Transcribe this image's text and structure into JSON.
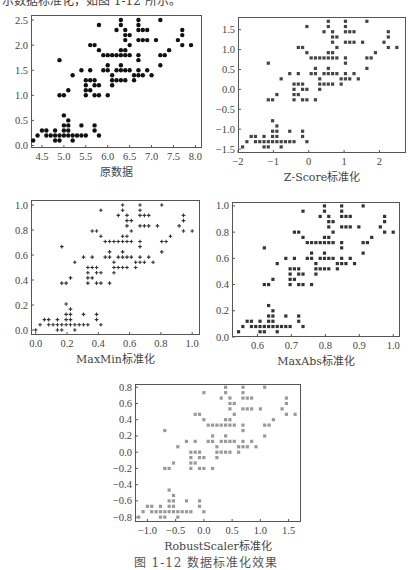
{
  "page": {
    "top_text": "示数据标准化，如图 1-12 所示。",
    "caption": "图 1-12  数据标准化效果"
  },
  "raw_points": [
    [
      5.1,
      0.2
    ],
    [
      4.9,
      0.2
    ],
    [
      4.7,
      0.2
    ],
    [
      4.6,
      0.2
    ],
    [
      5.0,
      0.2
    ],
    [
      5.4,
      0.4
    ],
    [
      4.6,
      0.3
    ],
    [
      5.0,
      0.2
    ],
    [
      4.4,
      0.2
    ],
    [
      4.9,
      0.1
    ],
    [
      5.4,
      0.2
    ],
    [
      4.8,
      0.2
    ],
    [
      4.8,
      0.1
    ],
    [
      4.3,
      0.1
    ],
    [
      5.8,
      0.2
    ],
    [
      5.7,
      0.4
    ],
    [
      5.4,
      0.4
    ],
    [
      5.1,
      0.3
    ],
    [
      5.7,
      0.3
    ],
    [
      5.1,
      0.3
    ],
    [
      5.4,
      0.2
    ],
    [
      5.1,
      0.4
    ],
    [
      4.6,
      0.2
    ],
    [
      5.1,
      0.5
    ],
    [
      4.8,
      0.2
    ],
    [
      5.0,
      0.2
    ],
    [
      5.0,
      0.4
    ],
    [
      5.2,
      0.2
    ],
    [
      5.2,
      0.2
    ],
    [
      4.7,
      0.2
    ],
    [
      4.8,
      0.2
    ],
    [
      5.4,
      0.4
    ],
    [
      5.2,
      0.1
    ],
    [
      5.5,
      0.2
    ],
    [
      4.9,
      0.2
    ],
    [
      5.0,
      0.2
    ],
    [
      5.5,
      0.2
    ],
    [
      4.9,
      0.1
    ],
    [
      4.4,
      0.2
    ],
    [
      5.1,
      0.2
    ],
    [
      5.0,
      0.3
    ],
    [
      4.5,
      0.3
    ],
    [
      4.4,
      0.2
    ],
    [
      5.0,
      0.6
    ],
    [
      5.1,
      0.4
    ],
    [
      4.8,
      0.3
    ],
    [
      5.1,
      0.2
    ],
    [
      4.6,
      0.2
    ],
    [
      5.3,
      0.2
    ],
    [
      5.0,
      0.2
    ],
    [
      7.0,
      1.4
    ],
    [
      6.4,
      1.5
    ],
    [
      6.9,
      1.5
    ],
    [
      5.5,
      1.3
    ],
    [
      6.5,
      1.5
    ],
    [
      5.7,
      1.3
    ],
    [
      6.3,
      1.6
    ],
    [
      4.9,
      1.0
    ],
    [
      6.6,
      1.3
    ],
    [
      5.2,
      1.4
    ],
    [
      5.0,
      1.0
    ],
    [
      5.9,
      1.5
    ],
    [
      6.0,
      1.0
    ],
    [
      6.1,
      1.4
    ],
    [
      5.6,
      1.3
    ],
    [
      6.7,
      1.4
    ],
    [
      5.6,
      1.5
    ],
    [
      5.8,
      1.0
    ],
    [
      6.2,
      1.5
    ],
    [
      5.6,
      1.1
    ],
    [
      5.9,
      1.8
    ],
    [
      6.1,
      1.3
    ],
    [
      6.3,
      1.5
    ],
    [
      6.1,
      1.2
    ],
    [
      6.4,
      1.3
    ],
    [
      6.6,
      1.4
    ],
    [
      6.8,
      1.4
    ],
    [
      6.7,
      1.7
    ],
    [
      6.0,
      1.5
    ],
    [
      5.7,
      1.0
    ],
    [
      5.5,
      1.1
    ],
    [
      5.5,
      1.0
    ],
    [
      5.8,
      1.2
    ],
    [
      6.0,
      1.6
    ],
    [
      5.4,
      1.5
    ],
    [
      6.0,
      1.6
    ],
    [
      6.7,
      1.5
    ],
    [
      6.3,
      1.3
    ],
    [
      5.6,
      1.3
    ],
    [
      5.5,
      1.3
    ],
    [
      5.5,
      1.2
    ],
    [
      6.1,
      1.4
    ],
    [
      5.8,
      1.2
    ],
    [
      5.0,
      1.0
    ],
    [
      5.6,
      1.3
    ],
    [
      5.7,
      1.2
    ],
    [
      5.7,
      1.3
    ],
    [
      6.2,
      1.3
    ],
    [
      5.1,
      1.1
    ],
    [
      5.7,
      1.3
    ],
    [
      6.3,
      2.5
    ],
    [
      5.8,
      1.9
    ],
    [
      7.1,
      2.1
    ],
    [
      6.3,
      1.8
    ],
    [
      6.5,
      2.2
    ],
    [
      7.6,
      2.1
    ],
    [
      4.9,
      1.7
    ],
    [
      7.3,
      1.8
    ],
    [
      6.7,
      1.8
    ],
    [
      7.2,
      2.5
    ],
    [
      6.5,
      2.0
    ],
    [
      6.4,
      1.9
    ],
    [
      6.8,
      2.1
    ],
    [
      5.7,
      2.0
    ],
    [
      5.8,
      2.4
    ],
    [
      6.4,
      2.3
    ],
    [
      6.5,
      1.8
    ],
    [
      7.7,
      2.2
    ],
    [
      7.7,
      2.3
    ],
    [
      6.0,
      1.5
    ],
    [
      6.9,
      2.3
    ],
    [
      5.6,
      2.0
    ],
    [
      7.7,
      2.0
    ],
    [
      6.3,
      1.8
    ],
    [
      6.7,
      2.1
    ],
    [
      7.2,
      1.8
    ],
    [
      6.2,
      1.8
    ],
    [
      6.1,
      1.8
    ],
    [
      6.4,
      2.1
    ],
    [
      7.2,
      1.6
    ],
    [
      7.4,
      1.9
    ],
    [
      7.9,
      2.0
    ],
    [
      6.4,
      2.2
    ],
    [
      6.3,
      1.5
    ],
    [
      6.1,
      1.4
    ],
    [
      7.7,
      2.3
    ],
    [
      6.3,
      2.4
    ],
    [
      6.4,
      1.8
    ],
    [
      6.0,
      1.8
    ],
    [
      6.9,
      2.1
    ],
    [
      6.7,
      2.4
    ],
    [
      6.9,
      2.3
    ],
    [
      5.8,
      1.9
    ],
    [
      6.8,
      2.3
    ],
    [
      6.7,
      2.5
    ],
    [
      6.7,
      2.3
    ],
    [
      6.3,
      1.9
    ],
    [
      6.5,
      2.0
    ],
    [
      6.2,
      2.3
    ],
    [
      5.9,
      1.8
    ]
  ],
  "chart_data": [
    {
      "type": "scatter",
      "id": "raw",
      "title": "",
      "xlabel": "原数据",
      "ylabel": "",
      "transform": "none",
      "marker": "circle",
      "color": "#111111",
      "frame": {
        "left": 31,
        "top": 15,
        "right": 202,
        "bottom": 148
      },
      "xlim": [
        4.25,
        8.15
      ],
      "ylim": [
        -0.05,
        2.6
      ],
      "xticks": [
        4.5,
        5.0,
        5.5,
        6.0,
        6.5,
        7.0,
        7.5,
        8.0
      ],
      "xtick_labels": [
        "4.5",
        "5.0",
        "5.5",
        "6.0",
        "6.5",
        "7.0",
        "7.5",
        "8.0"
      ],
      "yticks": [
        0.0,
        0.5,
        1.0,
        1.5,
        2.0,
        2.5
      ],
      "ytick_labels": [
        "0.0",
        "0.5",
        "1.0",
        "1.5",
        "2.0",
        "2.5"
      ],
      "grid": false
    },
    {
      "type": "scatter",
      "id": "zscore",
      "title": "",
      "xlabel": "Z-Score标准化",
      "ylabel": "",
      "transform": "zscore",
      "marker": "square",
      "color": "#444444",
      "frame": {
        "left": 238,
        "top": 17,
        "right": 406,
        "bottom": 153
      },
      "xlim": [
        -2.0,
        2.75
      ],
      "ylim": [
        -1.6,
        1.82
      ],
      "xticks": [
        -2,
        -1,
        0,
        1,
        2
      ],
      "xtick_labels": [
        "−2",
        "−1",
        "0",
        "1",
        "2"
      ],
      "yticks": [
        -1.5,
        -1.0,
        -0.5,
        0.0,
        0.5,
        1.0,
        1.5
      ],
      "ytick_labels": [
        "−1.5",
        "−1.0",
        "−0.5",
        "0.0",
        "0.5",
        "1.0",
        "1.5"
      ],
      "grid": false
    },
    {
      "type": "scatter",
      "id": "maxmin",
      "title": "",
      "xlabel": "MaxMin标准化",
      "ylabel": "",
      "transform": "minmax",
      "marker": "plus",
      "color": "#333333",
      "frame": {
        "left": 31,
        "top": 200,
        "right": 200,
        "bottom": 335
      },
      "xlim": [
        -0.03,
        1.05
      ],
      "ylim": [
        -0.04,
        1.04
      ],
      "xticks": [
        0.0,
        0.2,
        0.4,
        0.6,
        0.8,
        1.0
      ],
      "xtick_labels": [
        "0.0",
        "0.2",
        "0.4",
        "0.6",
        "0.8",
        "1.0"
      ],
      "yticks": [
        0.0,
        0.2,
        0.4,
        0.6,
        0.8,
        1.0
      ],
      "ytick_labels": [
        "0.0",
        "0.2",
        "0.4",
        "0.6",
        "0.8",
        "1.0"
      ],
      "grid": false
    },
    {
      "type": "scatter",
      "id": "maxabs",
      "title": "",
      "xlabel": "MaxAbs标准化",
      "ylabel": "",
      "transform": "maxabs",
      "marker": "square",
      "color": "#333333",
      "frame": {
        "left": 232,
        "top": 202,
        "right": 400,
        "bottom": 337
      },
      "xlim": [
        0.525,
        1.02
      ],
      "ylim": [
        0.0,
        1.03
      ],
      "xticks": [
        0.6,
        0.7,
        0.8,
        0.9,
        1.0
      ],
      "xtick_labels": [
        "0.6",
        "0.7",
        "0.8",
        "0.9",
        "1.0"
      ],
      "yticks": [
        0.0,
        0.2,
        0.4,
        0.6,
        0.8,
        1.0
      ],
      "ytick_labels": [
        "0.0",
        "0.2",
        "0.4",
        "0.6",
        "0.8",
        "1.0"
      ],
      "grid": false
    },
    {
      "type": "scatter",
      "id": "robust",
      "title": "",
      "xlabel": "RobustScaler标准化",
      "ylabel": "",
      "transform": "robust",
      "marker": "square",
      "color": "#999999",
      "frame": {
        "left": 135,
        "top": 384,
        "right": 301,
        "bottom": 522
      },
      "xlim": [
        -1.22,
        1.72
      ],
      "ylim": [
        -0.86,
        0.84
      ],
      "xticks": [
        -1.0,
        -0.5,
        0.0,
        0.5,
        1.0,
        1.5
      ],
      "xtick_labels": [
        "−1.0",
        "−0.5",
        "0.0",
        "0.5",
        "1.0",
        "1.5"
      ],
      "yticks": [
        -0.8,
        -0.6,
        -0.4,
        -0.2,
        0.0,
        0.2,
        0.4,
        0.6,
        0.8
      ],
      "ytick_labels": [
        "−0.8",
        "−0.6",
        "−0.4",
        "−0.2",
        "0.0",
        "0.2",
        "0.4",
        "0.6",
        "0.8"
      ],
      "grid": false
    }
  ]
}
